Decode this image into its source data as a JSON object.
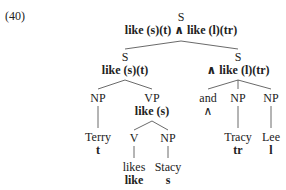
{
  "example_number": "(40)",
  "tree": {
    "root": {
      "cat": "S",
      "sem": "like (s)(t) ∧ like (l)(tr)"
    },
    "left_s": {
      "cat": "S",
      "sem": "like (s)(t)"
    },
    "right_s": {
      "cat": "S",
      "sem": "∧ like (l)(tr)"
    },
    "np_subj": {
      "cat": "NP",
      "word": "Terry",
      "sem": "t"
    },
    "vp": {
      "cat": "VP",
      "sem": "like (s)"
    },
    "v": {
      "cat": "V",
      "word": "likes",
      "sem": "like"
    },
    "np_obj": {
      "cat": "NP",
      "word": "Stacy",
      "sem": "s"
    },
    "conj": {
      "word": "and",
      "sem": "∧"
    },
    "np_tracy": {
      "cat": "NP",
      "word": "Tracy",
      "sem": "tr"
    },
    "np_lee": {
      "cat": "NP",
      "word": "Lee",
      "sem": "l"
    }
  }
}
